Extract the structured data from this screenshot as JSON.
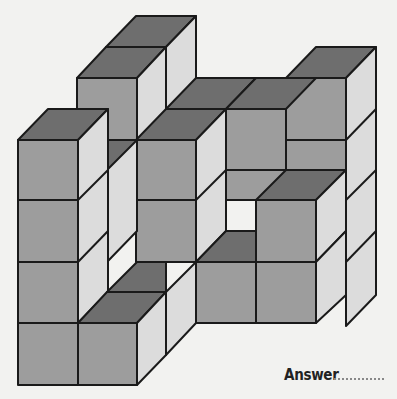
{
  "puzzle": {
    "type": "isometric cube counting",
    "answer_label": "Answer",
    "answer_value": ""
  },
  "colors": {
    "background": "#f2f2f0",
    "top_face": "#6e6e6e",
    "front_face": "#9d9d9d",
    "side_face": "#dcdcdc",
    "stroke": "#1a1a1a"
  },
  "faces": [
    {
      "k": "top",
      "p": "136,16 196,16 166,47 106,47"
    },
    {
      "k": "side",
      "p": "166,47 196,16 196,109 166,140"
    },
    {
      "k": "top",
      "p": "106,47 166,47 137,78 77,78"
    },
    {
      "k": "front",
      "p": "77,78 137,78 137,140 77,140"
    },
    {
      "k": "side",
      "p": "137,78 166,47 166,140 137,170"
    },
    {
      "k": "top",
      "p": "316,47 376,47 346,78 286,78"
    },
    {
      "k": "side",
      "p": "346,78 376,47 376,295 346,326"
    },
    {
      "k": "front",
      "p": "286,78 346,78 346,200 286,200"
    },
    {
      "k": "top",
      "p": "196,78 256,78 226,109 166,109"
    },
    {
      "k": "top",
      "p": "256,78 316,78 286,109 226,109"
    },
    {
      "k": "front",
      "p": "226,109 286,109 286,200 226,200"
    },
    {
      "k": "top",
      "p": "166,109 226,109 196,140 136,140"
    },
    {
      "k": "front",
      "p": "136,140 196,140 196,262 136,262"
    },
    {
      "k": "side",
      "p": "196,140 226,109 226,231 196,262"
    },
    {
      "k": "front",
      "p": "226,170 286,170 286,200 226,200"
    },
    {
      "k": "top",
      "p": "286,170 346,170 316,200 256,200"
    },
    {
      "k": "front",
      "p": "256,200 316,200 316,262 256,262"
    },
    {
      "k": "side",
      "p": "316,200 346,170 346,231 316,262"
    },
    {
      "k": "top",
      "p": "226,231 256,231 256,262 196,262"
    },
    {
      "k": "front",
      "p": "196,262 256,262 256,323 196,323"
    },
    {
      "k": "front",
      "p": "256,262 316,262 316,323 256,323"
    },
    {
      "k": "side",
      "p": "316,262 346,231 346,295 316,323"
    },
    {
      "k": "side",
      "p": "107,140 137,140 137,231 107,262"
    },
    {
      "k": "top",
      "p": "107,140 137,140 107,170 107,170"
    },
    {
      "k": "top",
      "p": "48,109 108,109 78,140 18,140"
    },
    {
      "k": "front",
      "p": "18,140 78,140 78,385 18,385"
    },
    {
      "k": "side",
      "p": "78,140 108,109 108,292 78,323"
    },
    {
      "k": "top",
      "p": "137,262 166,262 166,292 107,292"
    },
    {
      "k": "top",
      "p": "107,292 166,292 137,323 78,323"
    },
    {
      "k": "front",
      "p": "78,323 137,323 137,385 78,385"
    },
    {
      "k": "side",
      "p": "137,323 166,292 166,355 137,385"
    },
    {
      "k": "side",
      "p": "166,292 196,262 196,323 166,355"
    }
  ],
  "lines": [
    "18,200 78,200",
    "18,262 78,262",
    "18,323 78,323",
    "78,200 108,170",
    "78,262 108,231",
    "136,200 196,200",
    "196,200 226,170",
    "286,140 346,140",
    "346,140 376,109",
    "346,200 376,170",
    "346,262 376,231",
    "226,170 226,200"
  ]
}
